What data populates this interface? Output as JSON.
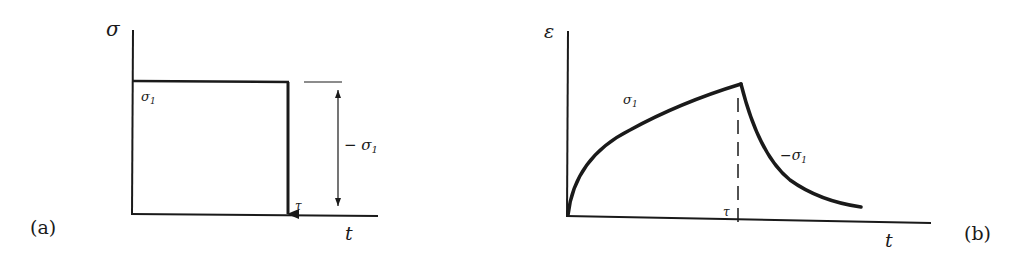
{
  "panel_a": {
    "label": "(a)",
    "y_axis_label": "σ",
    "x_axis_label": "t",
    "level_label": "σ",
    "level_sub": "1",
    "drop_label": "τ",
    "dimension_label": "− σ",
    "dimension_sub": "1"
  },
  "panel_b": {
    "label": "(b)",
    "y_axis_label": "ε",
    "x_axis_label": "t",
    "rise_label": "σ",
    "rise_sub": "1",
    "decay_label": "−σ",
    "decay_sub": "1",
    "tau_label": "τ"
  },
  "colors": {
    "ink": "#1a1a1a",
    "background": "#ffffff"
  }
}
